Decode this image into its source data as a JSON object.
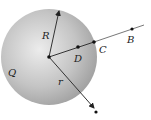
{
  "diagram": {
    "sphere_label": "Q",
    "radius_label": "R",
    "distance_label": "r",
    "points": {
      "B": "B",
      "C": "C",
      "D": "D"
    },
    "colors": {
      "sphere_light": "#e6e6e6",
      "sphere_dark": "#9a9a9a",
      "line": "#333333"
    }
  }
}
